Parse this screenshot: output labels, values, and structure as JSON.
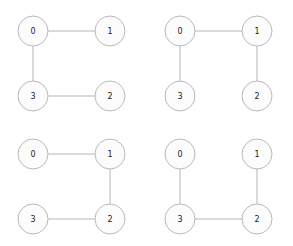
{
  "figure": {
    "width": 293,
    "height": 246,
    "background_color": "#ffffff",
    "node_fill_color": "#fcfcfc",
    "node_stroke_color": "#b9b9b9",
    "edge_color": "#b5b5b5",
    "label_color": "#1a1a1a",
    "node_radius": 15
  },
  "chart_data": {
    "type": "diagram",
    "title": "",
    "layout": {
      "rows": 2,
      "cols": 2
    },
    "node_positions": {
      "0": {
        "x": 33,
        "y": 31
      },
      "1": {
        "x": 110,
        "y": 31
      },
      "2": {
        "x": 110,
        "y": 96
      },
      "3": {
        "x": 33,
        "y": 96
      }
    },
    "panels": [
      {
        "index": 0,
        "position": "top-left",
        "nodes": [
          {
            "id": "0",
            "label": "0",
            "x": 33,
            "y": 31
          },
          {
            "id": "1",
            "label": "1",
            "x": 110,
            "y": 31
          },
          {
            "id": "2",
            "label": "2",
            "x": 110,
            "y": 96
          },
          {
            "id": "3",
            "label": "3",
            "x": 33,
            "y": 96
          }
        ],
        "edges": [
          {
            "source": "0",
            "target": "1"
          },
          {
            "source": "0",
            "target": "3"
          },
          {
            "source": "3",
            "target": "2"
          }
        ],
        "missing_edge": {
          "source": "1",
          "target": "2"
        }
      },
      {
        "index": 1,
        "position": "top-right",
        "nodes": [
          {
            "id": "0",
            "label": "0",
            "x": 33,
            "y": 31
          },
          {
            "id": "1",
            "label": "1",
            "x": 110,
            "y": 31
          },
          {
            "id": "2",
            "label": "2",
            "x": 110,
            "y": 96
          },
          {
            "id": "3",
            "label": "3",
            "x": 33,
            "y": 96
          }
        ],
        "edges": [
          {
            "source": "0",
            "target": "1"
          },
          {
            "source": "0",
            "target": "3"
          },
          {
            "source": "1",
            "target": "2"
          }
        ],
        "missing_edge": {
          "source": "3",
          "target": "2"
        }
      },
      {
        "index": 2,
        "position": "bottom-left",
        "nodes": [
          {
            "id": "0",
            "label": "0",
            "x": 33,
            "y": 31
          },
          {
            "id": "1",
            "label": "1",
            "x": 110,
            "y": 31
          },
          {
            "id": "2",
            "label": "2",
            "x": 110,
            "y": 96
          },
          {
            "id": "3",
            "label": "3",
            "x": 33,
            "y": 96
          }
        ],
        "edges": [
          {
            "source": "0",
            "target": "1"
          },
          {
            "source": "1",
            "target": "2"
          },
          {
            "source": "3",
            "target": "2"
          }
        ],
        "missing_edge": {
          "source": "0",
          "target": "3"
        }
      },
      {
        "index": 3,
        "position": "bottom-right",
        "nodes": [
          {
            "id": "0",
            "label": "0",
            "x": 33,
            "y": 31
          },
          {
            "id": "1",
            "label": "1",
            "x": 110,
            "y": 31
          },
          {
            "id": "2",
            "label": "2",
            "x": 110,
            "y": 96
          },
          {
            "id": "3",
            "label": "3",
            "x": 33,
            "y": 96
          }
        ],
        "edges": [
          {
            "source": "0",
            "target": "3"
          },
          {
            "source": "1",
            "target": "2"
          },
          {
            "source": "3",
            "target": "2"
          }
        ],
        "missing_edge": {
          "source": "0",
          "target": "1"
        }
      }
    ]
  }
}
